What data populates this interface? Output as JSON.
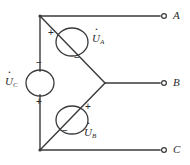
{
  "figure": {
    "background_color": "#ffffff",
    "line_color": "#3a3a3a"
  },
  "terminals": [
    {
      "id": "A",
      "label": "A",
      "x": 164,
      "y": 16
    },
    {
      "id": "B",
      "label": "B",
      "x": 164,
      "y": 83
    },
    {
      "id": "C",
      "label": "C",
      "x": 164,
      "y": 150
    }
  ],
  "sources": [
    {
      "id": "UA",
      "symbol": "U",
      "subscript": "A",
      "label_position": "right",
      "plus_sign": "+",
      "minus_sign": "−",
      "plus_position": "upper-left",
      "minus_position": "lower-right",
      "center_x": 72,
      "center_y": 42
    },
    {
      "id": "UB",
      "symbol": "U",
      "subscript": "B",
      "label_position": "lower-right",
      "plus_sign": "+",
      "minus_sign": "−",
      "plus_position": "upper-right",
      "minus_position": "lower-left",
      "center_x": 72,
      "center_y": 120
    },
    {
      "id": "UC",
      "symbol": "U",
      "subscript": "C",
      "label_position": "left",
      "plus_sign": "+",
      "minus_sign": "−",
      "plus_position": "below",
      "minus_position": "above",
      "center_x": 40,
      "center_y": 83
    }
  ],
  "nodes": [
    {
      "id": "top-left",
      "x": 40,
      "y": 16
    },
    {
      "id": "bottom-left",
      "x": 40,
      "y": 150
    },
    {
      "id": "star-point",
      "x": 105,
      "y": 83
    }
  ]
}
